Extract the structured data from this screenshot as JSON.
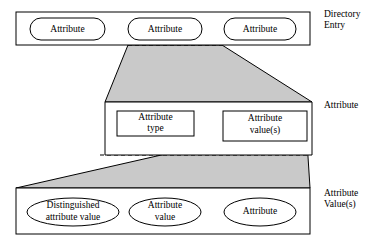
{
  "figure": {
    "background_color": "#ffffff",
    "line_color": "#000000",
    "shade_color": "#c9c9c9"
  },
  "levels": [
    {
      "id": "directory-entry",
      "side_label_line1": "Directory",
      "side_label_line2": "Entry",
      "nodes": [
        {
          "id": "entry-attribute-1",
          "shape": "rounded-rect",
          "label": "Attribute"
        },
        {
          "id": "entry-attribute-2",
          "shape": "rounded-rect",
          "label": "Attribute"
        },
        {
          "id": "entry-attribute-3",
          "shape": "rounded-rect",
          "label": "Attribute"
        }
      ]
    },
    {
      "id": "attribute",
      "side_label_line1": "Attribute",
      "side_label_line2": "",
      "nodes": [
        {
          "id": "attribute-type",
          "shape": "rect",
          "label_line1": "Attribute",
          "label_line2": "type"
        },
        {
          "id": "attribute-values",
          "shape": "rect",
          "label_line1": "Attribute",
          "label_line2": "value(s)"
        }
      ]
    },
    {
      "id": "attribute-values",
      "side_label_line1": "Attribute",
      "side_label_line2": "Value(s)",
      "nodes": [
        {
          "id": "distinguished-attribute-value",
          "shape": "ellipse",
          "label_line1": "Distinguished",
          "label_line2": "attribute value"
        },
        {
          "id": "attribute-value",
          "shape": "ellipse",
          "label_line1": "Attribute",
          "label_line2": "value"
        },
        {
          "id": "attribute-plain",
          "shape": "ellipse",
          "label_line1": "Attribute",
          "label_line2": ""
        }
      ]
    }
  ],
  "connectors": [
    {
      "id": "zoom-band-upper",
      "from": "entry-attribute-2",
      "to": "attribute",
      "style": "shaded-trapezoid"
    },
    {
      "id": "zoom-band-lower",
      "from": "attribute-values",
      "to": "attribute-values-level",
      "style": "shaded-trapezoid"
    }
  ]
}
